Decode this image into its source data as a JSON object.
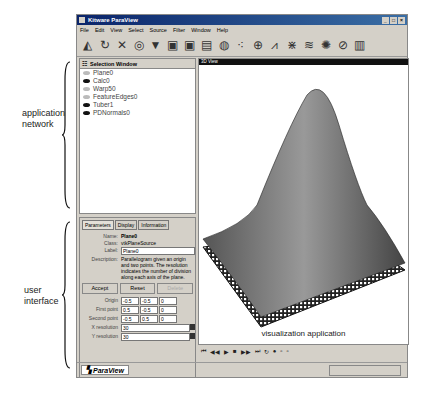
{
  "annotations": {
    "network": [
      "application",
      "network"
    ],
    "ui": [
      "user",
      "interface"
    ],
    "viz": "visualization application"
  },
  "window": {
    "title": "Kitware ParaView",
    "controls": [
      "_",
      "□",
      "×"
    ]
  },
  "menu": [
    "File",
    "Edit",
    "View",
    "Select",
    "Source",
    "Filter",
    "Window",
    "Help"
  ],
  "toolbar": [
    "reset-camera-icon",
    "rotate-icon",
    "pick-icon",
    "sphere-source-icon",
    "cone-source-icon",
    "cube-icon",
    "box-icon",
    "threshold-icon",
    "contour-icon",
    "glyph-icon",
    "clip-icon",
    "plot-icon",
    "probe-icon",
    "streamline-icon",
    "slice-icon",
    "cut-icon",
    "extract-icon"
  ],
  "selection_window": {
    "title": "Selection Window",
    "items": [
      {
        "label": "Plane0",
        "visible": false
      },
      {
        "label": "Calc0",
        "visible": true
      },
      {
        "label": "Warp50",
        "visible": false
      },
      {
        "label": "FeatureEdges0",
        "visible": false
      },
      {
        "label": "Tuber1",
        "visible": true
      },
      {
        "label": "PDNormals0",
        "visible": true
      }
    ]
  },
  "props": {
    "tabs": [
      "Parameters",
      "Display",
      "Information"
    ],
    "name_label": "Name:",
    "name": "Plane0",
    "class_label": "Class:",
    "class": "vtkPlaneSource",
    "label_label": "Label:",
    "label": "Plane0",
    "desc_label": "Description:",
    "description": "Parallelogram given an origin and two points. The resolution indicates the number of division along each axis of the plane.",
    "accept": "Accept",
    "reset": "Reset",
    "delete": "Delete",
    "origin_label": "Origin",
    "origin": [
      "-0.5",
      "-0.5",
      "0"
    ],
    "p1_label": "First point",
    "p1": [
      "0.5",
      "-0.5",
      "0"
    ],
    "p2_label": "Second point",
    "p2": [
      "-0.5",
      "0.5",
      "0"
    ],
    "xres_label": "X resolution",
    "xres": "30",
    "yres_label": "Y resolution",
    "yres": "30"
  },
  "view": {
    "title": "3D View",
    "caption": "visualization application"
  },
  "animation": [
    "⏮",
    "◀◀",
    "▶",
    "■",
    "▶▶",
    "⏭",
    "↻",
    "●",
    "▫",
    "▫"
  ],
  "status": {
    "label": "ParaView"
  }
}
